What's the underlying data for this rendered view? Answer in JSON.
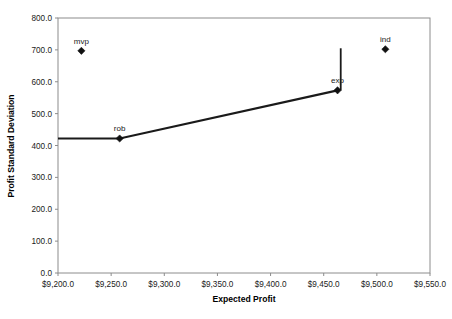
{
  "chart_data": {
    "type": "scatter",
    "title": "",
    "xlabel": "Expected Profit",
    "ylabel": "Profit Standard Deviation",
    "xlim": [
      9200,
      9550
    ],
    "ylim": [
      0,
      800
    ],
    "grid": false,
    "legend": "none",
    "x_tick_labels": [
      "$9,200.0",
      "$9,250.0",
      "$9,300.0",
      "$9,350.0",
      "$9,400.0",
      "$9,450.0",
      "$9,500.0",
      "$9,550.0"
    ],
    "x_tick_values": [
      9200,
      9250,
      9300,
      9350,
      9400,
      9450,
      9500,
      9550
    ],
    "y_tick_labels": [
      "0.0",
      "100.0",
      "200.0",
      "300.0",
      "400.0",
      "500.0",
      "600.0",
      "700.0",
      "800.0"
    ],
    "y_tick_values": [
      0,
      100,
      200,
      300,
      400,
      500,
      600,
      700,
      800
    ],
    "points": [
      {
        "label": "mvp",
        "x": 9222,
        "y": 697,
        "marker": "diamond"
      },
      {
        "label": "rob",
        "x": 9258,
        "y": 422,
        "marker": "diamond"
      },
      {
        "label": "exp",
        "x": 9463,
        "y": 573,
        "marker": "diamond"
      },
      {
        "label": "ind",
        "x": 9508,
        "y": 702,
        "marker": "diamond"
      }
    ],
    "series": [
      {
        "name": "frontier",
        "type": "line",
        "points": [
          {
            "x": 9200,
            "y": 422
          },
          {
            "x": 9258,
            "y": 422
          },
          {
            "x": 9463,
            "y": 573
          }
        ]
      }
    ],
    "annotations": [
      {
        "name": "exp-vertical-bar",
        "type": "vertical-segment",
        "x": 9466,
        "y_bottom": 573,
        "y_top": 705
      }
    ]
  }
}
